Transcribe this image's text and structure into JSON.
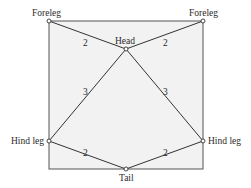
{
  "diagram": {
    "type": "weighted-graph",
    "box": {
      "x": 49,
      "y": 21,
      "width": 154,
      "height": 148,
      "fill": "#f2f2f2",
      "stroke": "#555555"
    },
    "nodes": [
      {
        "id": "foreleg_left",
        "label": "Foreleg",
        "x": 49,
        "y": 21
      },
      {
        "id": "foreleg_right",
        "label": "Foreleg",
        "x": 203,
        "y": 21
      },
      {
        "id": "head",
        "label": "Head",
        "x": 126,
        "y": 49
      },
      {
        "id": "hindleg_left",
        "label": "Hind leg",
        "x": 49,
        "y": 141
      },
      {
        "id": "hindleg_right",
        "label": "Hind leg",
        "x": 203,
        "y": 141
      },
      {
        "id": "tail",
        "label": "Tail",
        "x": 126,
        "y": 169
      }
    ],
    "edges": [
      {
        "from": "foreleg_left",
        "to": "head",
        "weight": "2"
      },
      {
        "from": "foreleg_right",
        "to": "head",
        "weight": "2"
      },
      {
        "from": "head",
        "to": "hindleg_left",
        "weight": "3"
      },
      {
        "from": "head",
        "to": "hindleg_right",
        "weight": "3"
      },
      {
        "from": "hindleg_left",
        "to": "tail",
        "weight": "2"
      },
      {
        "from": "hindleg_right",
        "to": "tail",
        "weight": "2"
      }
    ],
    "labels": {
      "foreleg_left": "Foreleg",
      "foreleg_right": "Foreleg",
      "head": "Head",
      "hindleg_left": "Hind leg",
      "hindleg_right": "Hind leg",
      "tail": "Tail"
    },
    "weights": {
      "e1": "2",
      "e2": "2",
      "e3": "3",
      "e4": "3",
      "e5": "2",
      "e6": "2"
    }
  }
}
